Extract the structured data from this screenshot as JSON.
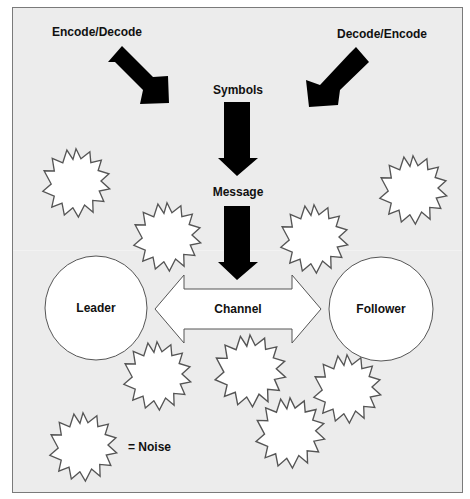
{
  "diagram": {
    "title": "",
    "labels": {
      "encode_decode": "Encode/Decode",
      "decode_encode": "Decode/Encode",
      "symbols": "Symbols",
      "message": "Message",
      "channel": "Channel",
      "leader": "Leader",
      "follower": "Follower",
      "legend_noise": "= Noise"
    },
    "nodes": [
      {
        "id": "leader",
        "label": "Leader",
        "shape": "circle"
      },
      {
        "id": "follower",
        "label": "Follower",
        "shape": "circle"
      }
    ],
    "edges": [
      {
        "from": "leader",
        "to": "follower",
        "label": "Channel",
        "type": "bidirectional"
      },
      {
        "from": "encode_decode",
        "to": "symbols",
        "type": "arrow"
      },
      {
        "from": "decode_encode",
        "to": "symbols",
        "type": "arrow"
      },
      {
        "from": "symbols",
        "to": "message",
        "type": "arrow"
      },
      {
        "from": "message",
        "to": "channel",
        "type": "arrow"
      }
    ],
    "noise_count": 8,
    "legend": [
      {
        "symbol": "starburst",
        "meaning": "Noise"
      }
    ],
    "colors": {
      "background": "#ececec",
      "border": "#7a7a7a",
      "arrow_fill": "#000000",
      "shape_fill": "#ffffff",
      "shape_stroke": "#555555",
      "text": "#111111"
    }
  }
}
